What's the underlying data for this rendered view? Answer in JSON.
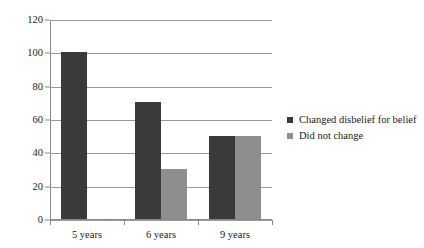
{
  "chart_data": {
    "type": "bar",
    "title": "",
    "xlabel": "",
    "ylabel": "",
    "categories": [
      "5 years",
      "6 years",
      "9 years"
    ],
    "series": [
      {
        "name": "Changed disbelief for belief",
        "color": "#3a3a3a",
        "values": [
          100,
          70,
          50
        ]
      },
      {
        "name": "Did not change",
        "color": "#8e8e8e",
        "values": [
          0,
          30,
          50
        ]
      }
    ],
    "ylim": [
      0,
      120
    ],
    "ytick_values": [
      0,
      20,
      40,
      60,
      80,
      100,
      120
    ],
    "ytick_labels": [
      "0",
      "20",
      "40",
      "60",
      "80",
      "100",
      "120"
    ],
    "grid": true,
    "legend_position": "right",
    "grouped": true
  },
  "legend": {
    "items": [
      {
        "label": "Changed disbelief for belief",
        "swatch": "#3a3a3a"
      },
      {
        "label": "Did not change",
        "swatch": "#8e8e8e"
      }
    ]
  }
}
